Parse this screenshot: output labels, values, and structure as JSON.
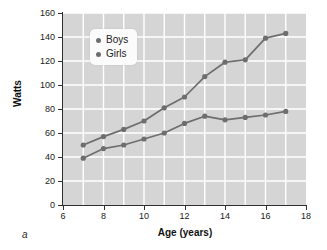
{
  "panel": {
    "label": "a"
  },
  "legend": {
    "position": "upper-left-inside",
    "entries": [
      {
        "label": "Boys",
        "marker": "legend-dot-icon",
        "color": "#6e6e6e"
      },
      {
        "label": "Girls",
        "marker": "legend-dot-icon",
        "color": "#6e6e6e"
      }
    ]
  },
  "axes": {
    "x_tick_labels": [
      "6",
      "8",
      "10",
      "12",
      "14",
      "16",
      "18"
    ],
    "y_tick_labels": [
      "0",
      "20",
      "40",
      "60",
      "80",
      "100",
      "120",
      "140",
      "160"
    ]
  },
  "style": {
    "plot_background": "#d5d5d5",
    "gridline_color": "#ffffff",
    "series_color": "#6e6e6e",
    "axis_color": "#303030",
    "text_color": "#1a1a1a"
  },
  "chart_data": {
    "type": "line",
    "title": "",
    "xlabel": "Age (years)",
    "ylabel": "Watts",
    "xlim": [
      6,
      18
    ],
    "ylim": [
      0,
      160
    ],
    "xticks": [
      6,
      8,
      10,
      12,
      14,
      16,
      18
    ],
    "yticks": [
      0,
      20,
      40,
      60,
      80,
      100,
      120,
      140,
      160
    ],
    "x_minor_gridlines": [
      7,
      9,
      11,
      13,
      15,
      17
    ],
    "grid": true,
    "grid_color": "#ffffff",
    "legend": [
      "Boys",
      "Girls"
    ],
    "legend_position": "upper left",
    "marker": "circle",
    "x": [
      7,
      8,
      9,
      10,
      11,
      12,
      13,
      14,
      15,
      16,
      17
    ],
    "series": [
      {
        "name": "Boys",
        "color": "#6e6e6e",
        "values": [
          50,
          57,
          63,
          70,
          81,
          90,
          107,
          119,
          121,
          139,
          143
        ]
      },
      {
        "name": "Girls",
        "color": "#6e6e6e",
        "values": [
          39,
          47,
          50,
          55,
          60,
          68,
          74,
          71,
          73,
          75,
          78
        ]
      }
    ]
  }
}
